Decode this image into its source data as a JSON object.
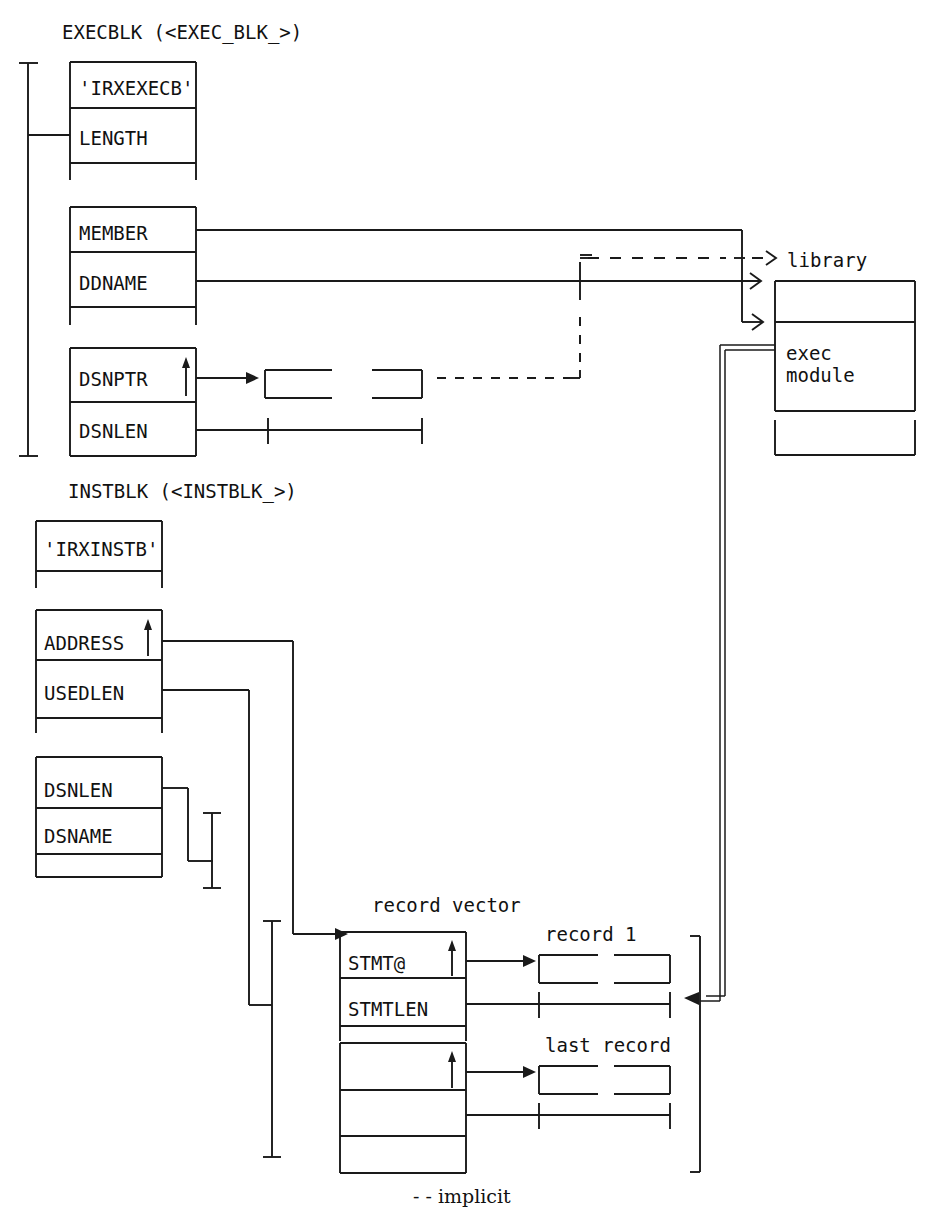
{
  "diagram": {
    "title_execblk": "EXECBLK (<EXEC_BLK_>)",
    "title_instblk": "INSTBLK (<INSTBLK_>)",
    "legend": "- - implicit",
    "execblk": {
      "eyecatcher": "'IRXEXECB'",
      "length": "LENGTH",
      "member": "MEMBER",
      "ddname": "DDNAME",
      "dsnptr": "DSNPTR",
      "dsnlen": "DSNLEN",
      "pointer_glyph": "↑"
    },
    "instblk": {
      "eyecatcher": "'IRXINSTB'",
      "address": "ADDRESS",
      "usedlen": "USEDLEN",
      "dsnlen": "DSNLEN",
      "dsname": "DSNAME",
      "pointer_glyph": "↑"
    },
    "record_vector": {
      "label": "record vector",
      "stmt_addr": "STMT@",
      "stmt_len": "STMTLEN",
      "pointer_glyph": "↑",
      "last_stmt_addr": "",
      "last_stmt_len": ""
    },
    "targets": {
      "library": "library",
      "exec_module_line1": "exec",
      "exec_module_line2": "module",
      "record_1": "record 1",
      "last_record": "last record"
    },
    "colors": {
      "ink": "#1a1a1a",
      "paper": "#ffffff"
    }
  }
}
